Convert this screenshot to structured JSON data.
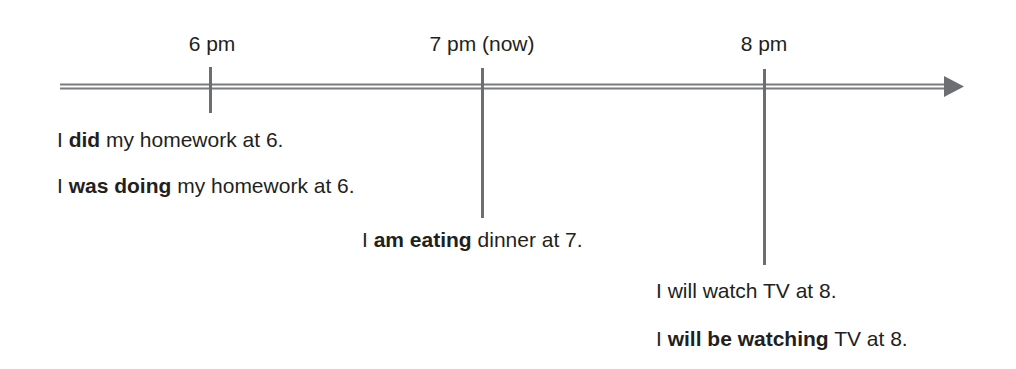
{
  "diagram": {
    "type": "timeline",
    "axis": {
      "color": "#6d6e71",
      "direction": "left-to-right",
      "has_arrowhead": true
    },
    "ticks": [
      {
        "label": "6 pm",
        "x": 210
      },
      {
        "label": "7 pm (now)",
        "x": 482
      },
      {
        "label": "8 pm",
        "x": 764
      }
    ],
    "sentences": [
      {
        "prefix": "I ",
        "bold": "did",
        "suffix": " my homework at 6."
      },
      {
        "prefix": "I ",
        "bold": "was doing",
        "suffix": " my homework at 6."
      },
      {
        "prefix": "I ",
        "bold": "am eating",
        "suffix": " dinner at 7."
      },
      {
        "prefix": "I will watch TV at 8.",
        "bold": "",
        "suffix": ""
      },
      {
        "prefix": "I ",
        "bold": "will be watching",
        "suffix": " TV at 8."
      }
    ]
  }
}
